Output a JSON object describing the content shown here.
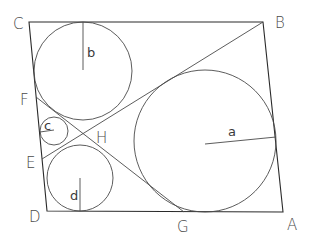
{
  "diagram": {
    "type": "geometry-figure",
    "colors": {
      "stroke": "#2a2a2a",
      "label": "#4a4a4a",
      "background": "#ffffff"
    },
    "vertices": {
      "A": {
        "label": "A",
        "x": 283,
        "y": 212
      },
      "B": {
        "label": "B",
        "x": 263,
        "y": 22
      },
      "C": {
        "label": "C",
        "x": 29,
        "y": 22
      },
      "D": {
        "label": "D",
        "x": 47,
        "y": 211
      }
    },
    "points": {
      "E": {
        "label": "E"
      },
      "F": {
        "label": "F"
      },
      "G": {
        "label": "G"
      },
      "H": {
        "label": "H"
      }
    },
    "circles": [
      {
        "id": "a",
        "label": "a",
        "cx": 205,
        "cy": 141,
        "r": 71
      },
      {
        "id": "b",
        "label": "b",
        "cx": 83,
        "cy": 71,
        "r": 49
      },
      {
        "id": "c",
        "label": "c",
        "cx": 53,
        "cy": 131,
        "r": 14
      },
      {
        "id": "d",
        "label": "d",
        "cx": 78,
        "cy": 178,
        "r": 33
      }
    ],
    "lines": [
      {
        "id": "BE",
        "from": "B",
        "to": "E"
      },
      {
        "id": "FG",
        "from": "F",
        "to": "G"
      }
    ],
    "labels": {
      "A": "A",
      "B": "B",
      "C": "C",
      "D": "D",
      "E": "E",
      "F": "F",
      "G": "G",
      "H": "H",
      "a": "a",
      "b": "b",
      "c": "c",
      "d": "d"
    }
  }
}
